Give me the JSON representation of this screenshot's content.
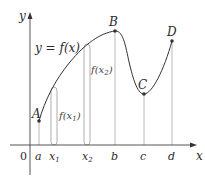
{
  "figure": {
    "type": "function-graph",
    "curve_label": "y = f(x)",
    "axes": {
      "x_label": "x",
      "y_label": "y",
      "origin_label": "0"
    },
    "points": [
      {
        "name": "A",
        "x": 39,
        "y": 121
      },
      {
        "name": "B",
        "x": 115,
        "y": 31
      },
      {
        "name": "C",
        "x": 144,
        "y": 94
      },
      {
        "name": "D",
        "x": 172,
        "y": 41
      }
    ],
    "x_ticks": [
      {
        "label": "a"
      },
      {
        "label": "x",
        "sub": "1"
      },
      {
        "label": "x",
        "sub": "2"
      },
      {
        "label": "b"
      },
      {
        "label": "c"
      },
      {
        "label": "d"
      }
    ],
    "brackets": [
      {
        "label": "f(x",
        "sub": "1",
        "close": ")"
      },
      {
        "label": "f(x",
        "sub": "2",
        "close": ")"
      }
    ],
    "colors": {
      "axis": "#555555",
      "curve": "#333333",
      "guide": "#9a9a9a",
      "point": "#333333"
    }
  }
}
